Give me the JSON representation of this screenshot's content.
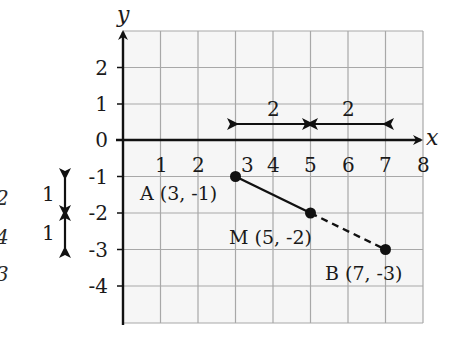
{
  "diagram": {
    "axes": {
      "x_label": "x",
      "y_label": "y",
      "x_ticks": [
        "1",
        "2",
        "3",
        "4",
        "5",
        "6",
        "7",
        "8"
      ],
      "y_ticks": [
        "2",
        "1",
        "0",
        "-1",
        "-2",
        "-3",
        "-4"
      ]
    },
    "points": [
      {
        "id": "A",
        "label": "A (3, -1)",
        "x": 3,
        "y": -1
      },
      {
        "id": "M",
        "label": "M (5, -2)",
        "x": 5,
        "y": -2
      },
      {
        "id": "B",
        "label": "B (7, -3)",
        "x": 7,
        "y": -3
      }
    ],
    "horizontal_distances": [
      "2",
      "2"
    ],
    "vertical_distances": [
      "1",
      "1"
    ],
    "margin_notes": [
      "2",
      "4",
      "3"
    ],
    "colors": {
      "axis": "#111111",
      "grid": "#a8a8a8",
      "grid_bg": "#f6f6f6",
      "segment": "#111111",
      "point": "#111111"
    }
  }
}
